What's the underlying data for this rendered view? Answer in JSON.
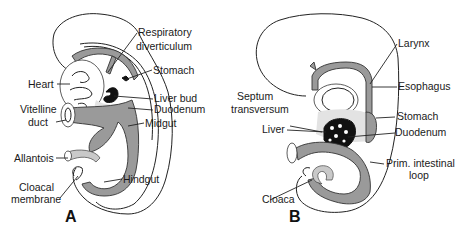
{
  "figure": {
    "panels": [
      {
        "id": "A",
        "label": "A",
        "structures": [
          "Respiratory diverticulum",
          "Stomach",
          "Heart",
          "Liver bud",
          "Duodenum",
          "Vitelline duct",
          "Midgut",
          "Allantois",
          "Hindgut",
          "Cloacal membrane"
        ],
        "labels": {
          "respiratory_line1": "Respiratory",
          "respiratory_line2": "diverticulum",
          "stomach": "Stomach",
          "heart": "Heart",
          "liver_bud": "Liver bud",
          "duodenum": "Duodenum",
          "vitelline_line1": "Vitelline",
          "vitelline_line2": "duct",
          "midgut": "Midgut",
          "allantois": "Allantois",
          "hindgut": "Hindgut",
          "cloacal_line1": "Cloacal",
          "cloacal_line2": "membrane"
        }
      },
      {
        "id": "B",
        "label": "B",
        "structures": [
          "Larynx",
          "Esophagus",
          "Septum transversum",
          "Stomach",
          "Liver",
          "Duodenum",
          "Prim. intestinal loop",
          "Cloaca"
        ],
        "labels": {
          "larynx": "Larynx",
          "esophagus": "Esophagus",
          "septum_line1": "Septum",
          "septum_line2": "transversum",
          "stomach": "Stomach",
          "liver": "Liver",
          "duodenum": "Duodenum",
          "intestinal_line1": "Prim. intestinal",
          "intestinal_line2": "loop",
          "cloaca": "Cloaca"
        }
      }
    ]
  }
}
